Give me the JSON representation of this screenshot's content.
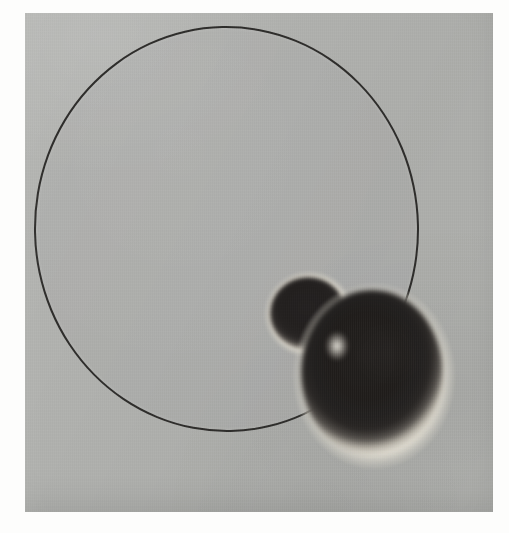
{
  "page": {
    "kind": "artwork-reproduction",
    "width_px": 509,
    "height_px": 533,
    "page_background_color": "#fdfdfc",
    "margin_description": "white page border surrounding a rectangular photographic plate"
  },
  "plate": {
    "name": "photographic-plate",
    "left_px": 25,
    "top_px": 13,
    "width_px": 468,
    "height_px": 499,
    "ground_color": "#b0b1ae",
    "texture": "fine vertical weave / halftone grain"
  },
  "shapes": [
    {
      "name": "large-outlined-circle",
      "type": "circle-outline",
      "center_px": [
        226,
        229
      ],
      "width_px": 385,
      "height_px": 406,
      "outline_color": "#2e2d2b",
      "outline_width_px": 2.6,
      "fill_color": "#b0b1ae",
      "note": "thin dark contour, interior same tone as ground; lower-right arc occluded by the large sphere"
    },
    {
      "name": "small-dark-sphere",
      "type": "sphere",
      "center_px": [
        309,
        313
      ],
      "width_px": 92,
      "height_px": 88,
      "core_color": "#221f1e",
      "halo_color": "#f2efe6",
      "note": "dark core with soft cream-white halo ring, feathered edge"
    },
    {
      "name": "large-dark-sphere",
      "type": "sphere",
      "center_px": [
        374,
        376
      ],
      "width_px": 164,
      "height_px": 188,
      "core_color": "#201d1b",
      "halo_color": "#efece2",
      "note": "dark core with soft cream-white halo ring; overlaps the small sphere and covers the circle outline"
    }
  ],
  "colors": {
    "ground": "#b0b1ae",
    "outline": "#2e2d2b",
    "sphere_core": "#201d1b",
    "sphere_halo": "#efece2",
    "page_margin": "#fdfdfc"
  }
}
